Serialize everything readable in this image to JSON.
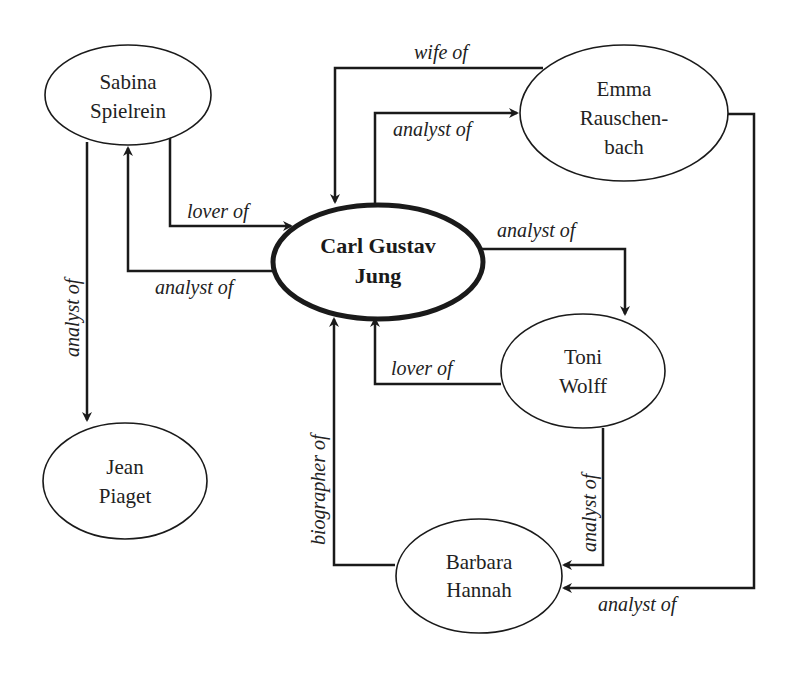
{
  "diagram": {
    "type": "relationship-graph",
    "nodes": {
      "sabina": {
        "line1": "Sabina",
        "line2": "Spielrein"
      },
      "jung": {
        "line1": "Carl Gustav",
        "line2": "Jung"
      },
      "emma": {
        "line1": "Emma",
        "line2": "Rauschen-",
        "line3": "bach"
      },
      "toni": {
        "line1": "Toni",
        "line2": "Wolff"
      },
      "barbara": {
        "line1": "Barbara",
        "line2": "Hannah"
      },
      "jean": {
        "line1": "Jean",
        "line2": "Piaget"
      }
    },
    "edges": [
      {
        "id": "sabina-lover-jung",
        "from": "Sabina Spielrein",
        "to": "Carl Gustav Jung",
        "label": "lover of"
      },
      {
        "id": "jung-analyst-sabina",
        "from": "Carl Gustav Jung",
        "to": "Sabina Spielrein",
        "label": "analyst of"
      },
      {
        "id": "sabina-analyst-jean",
        "from": "Sabina Spielrein",
        "to": "Jean Piaget",
        "label": "analyst of"
      },
      {
        "id": "emma-wife-jung",
        "from": "Emma Rauschenbach",
        "to": "Carl Gustav Jung",
        "label": "wife of"
      },
      {
        "id": "jung-analyst-emma",
        "from": "Carl Gustav Jung",
        "to": "Emma Rauschenbach",
        "label": "analyst of"
      },
      {
        "id": "jung-analyst-toni",
        "from": "Carl Gustav Jung",
        "to": "Toni Wolff",
        "label": "analyst of"
      },
      {
        "id": "toni-lover-jung",
        "from": "Toni Wolff",
        "to": "Carl Gustav Jung",
        "label": "lover of"
      },
      {
        "id": "barbara-biographer-jung",
        "from": "Barbara Hannah",
        "to": "Carl Gustav Jung",
        "label": "biographer of"
      },
      {
        "id": "toni-analyst-barbara",
        "from": "Toni Wolff",
        "to": "Barbara Hannah",
        "label": "analyst of"
      },
      {
        "id": "emma-analyst-barbara",
        "from": "Emma Rauschenbach",
        "to": "Barbara Hannah",
        "label": "analyst of"
      }
    ],
    "labels": {
      "lover_of_1": "lover of",
      "analyst_of_sabina": "analyst of",
      "analyst_of_jean": "analyst of",
      "wife_of": "wife of",
      "analyst_of_emma": "analyst of",
      "analyst_of_toni": "analyst of",
      "lover_of_2": "lover of",
      "biographer_of": "biographer of",
      "analyst_of_barbara_1": "analyst of",
      "analyst_of_barbara_2": "analyst of"
    }
  }
}
